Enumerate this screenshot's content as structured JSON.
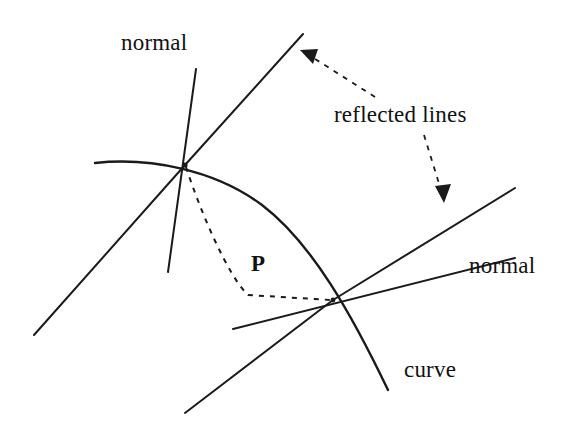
{
  "figure": {
    "background_color": "#ffffff",
    "stroke_color": "#1a1a1a",
    "width": 569,
    "height": 431,
    "labels": {
      "normal_top": "normal",
      "reflected_lines": "reflected lines",
      "normal_right": "normal",
      "curve": "curve",
      "point_p": "P"
    },
    "geometry": {
      "curve": {
        "description": "solid curve arcing from upper-left across to lower-right",
        "path": "M 95 163 C 150 157 215 170 262 205 C 312 243 352 315 388 390"
      },
      "upper_contact_point": [
        185,
        165
      ],
      "lower_contact_point": [
        333,
        300
      ],
      "normal_upper": {
        "from": [
          196,
          69
        ],
        "to": [
          168,
          272
        ]
      },
      "normal_lower": {
        "from": [
          233,
          329
        ],
        "to": [
          515,
          258
        ]
      },
      "incident_upper": {
        "from": [
          34,
          335
        ],
        "to": [
          185,
          165
        ]
      },
      "reflected_upper": {
        "from": [
          185,
          165
        ],
        "to": [
          303,
          34
        ]
      },
      "incident_lower": {
        "from": [
          185,
          413
        ],
        "to": [
          333,
          300
        ]
      },
      "reflected_lower": {
        "from": [
          333,
          300
        ],
        "to": [
          515,
          188
        ]
      },
      "dashed_path_p": "M 186 167 C 201 213 228 276 248 295 L 331 300",
      "arrow_to_upper_reflected": {
        "from": [
          375,
          97
        ],
        "to": [
          300,
          51
        ]
      },
      "arrow_to_lower_reflected": {
        "from": [
          424,
          135
        ],
        "to": [
          444,
          201
        ]
      }
    }
  }
}
